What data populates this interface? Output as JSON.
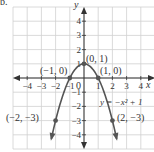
{
  "problem_label": "b.",
  "chart_data": {
    "type": "line",
    "title": "",
    "equation": "y = -x^2 + 1",
    "equation_label": "y = −x² + 1",
    "xlabel": "x",
    "ylabel": "y",
    "xlim": [
      -5,
      5
    ],
    "ylim": [
      -5,
      5
    ],
    "grid": true,
    "x_ticks": [
      -4,
      -3,
      -2,
      -1,
      1,
      2,
      3,
      4
    ],
    "y_ticks": [
      -4,
      -3,
      -2,
      -1,
      1,
      2,
      3,
      4
    ],
    "origin_label": "0",
    "series": [
      {
        "name": "y = -x^2 + 1",
        "x": [
          -2.3,
          -2,
          -1.5,
          -1,
          -0.5,
          0,
          0.5,
          1,
          1.5,
          2,
          2.3
        ],
        "y": [
          -4.29,
          -3,
          -1.25,
          0,
          0.75,
          1,
          0.75,
          0,
          -1.25,
          -3,
          -4.29
        ]
      }
    ],
    "points": [
      {
        "x": -2,
        "y": -3,
        "label": "(−2, −3)"
      },
      {
        "x": -1,
        "y": 0,
        "label": "(−1, 0)"
      },
      {
        "x": 0,
        "y": 1,
        "label": "(0, 1)"
      },
      {
        "x": 1,
        "y": 0,
        "label": "(1, 0)"
      },
      {
        "x": 2,
        "y": -3,
        "label": "(2, −3)"
      }
    ],
    "colors": {
      "curve": "#555555",
      "grid": "#d0d0d0",
      "axis": "#333333",
      "point": "#555555"
    }
  }
}
